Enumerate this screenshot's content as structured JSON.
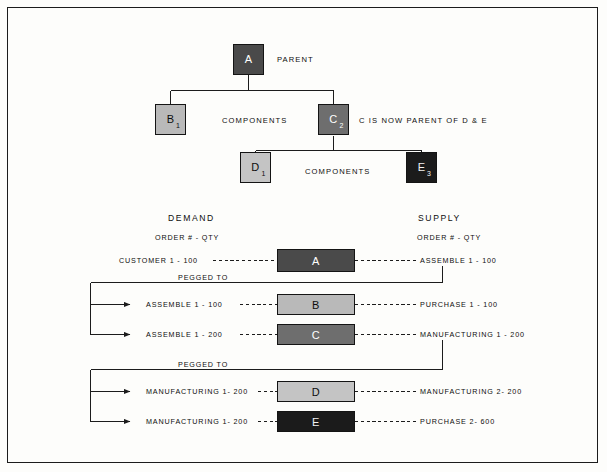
{
  "diagram": {
    "title_colors": {
      "node_a": "#4a4a4a",
      "node_b": "#b9b9b9",
      "node_c": "#6e6e6e",
      "node_d": "#c4c4c4",
      "node_e": "#1b1b1b",
      "border": "#141414",
      "line": "#1c1c1c",
      "page_bg": "#fdfdfb"
    },
    "bom": {
      "nodes": [
        {
          "id": "A",
          "label": "A",
          "subscript": "",
          "color": "#4a4a4a",
          "text_color": "#ffffff"
        },
        {
          "id": "B",
          "label": "B",
          "subscript": "1",
          "color": "#b9b9b9",
          "text_color": "#0d0d0d"
        },
        {
          "id": "C",
          "label": "C",
          "subscript": "2",
          "color": "#6e6e6e",
          "text_color": "#ffffff"
        },
        {
          "id": "D",
          "label": "D",
          "subscript": "1",
          "color": "#c4c4c4",
          "text_color": "#0d0d0d"
        },
        {
          "id": "E",
          "label": "E",
          "subscript": "3",
          "color": "#1b1b1b",
          "text_color": "#f2f2f2"
        }
      ],
      "annotations": {
        "parent": "PARENT",
        "components_1": "COMPONENTS",
        "components_2": "COMPONENTS",
        "c_note": "C IS NOW PARENT OF D & E"
      }
    },
    "pegging": {
      "headers": {
        "demand": "DEMAND",
        "supply": "SUPPLY",
        "demand_sub": "ORDER # - QTY",
        "supply_sub": "ORDER # - QTY"
      },
      "pegged_to_1": "PEGGED TO",
      "pegged_to_2": "PEGGED TO",
      "rows": [
        {
          "demand": "CUSTOMER 1 - 100",
          "item": "A",
          "supply": "ASSEMBLE 1 - 100",
          "color": "#4a4a4a",
          "text_color": "#ffffff"
        },
        {
          "demand": "ASSEMBLE 1 - 100",
          "item": "B",
          "supply": "PURCHASE 1 - 100",
          "color": "#b9b9b9",
          "text_color": "#0d0d0d"
        },
        {
          "demand": "ASSEMBLE 1 - 200",
          "item": "C",
          "supply": "MANUFACTURING 1 - 200",
          "color": "#6e6e6e",
          "text_color": "#ffffff"
        },
        {
          "demand": "MANUFACTURING 1- 200",
          "item": "D",
          "supply": "MANUFACTURING 2- 200",
          "color": "#c4c4c4",
          "text_color": "#0d0d0d"
        },
        {
          "demand": "MANUFACTURING 1- 200",
          "item": "E",
          "supply": "PURCHASE 2- 600",
          "color": "#1b1b1b",
          "text_color": "#f2f2f2"
        }
      ]
    }
  }
}
